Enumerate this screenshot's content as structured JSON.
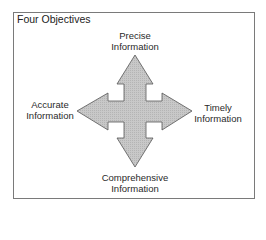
{
  "diagram": {
    "title": "Four Objectives",
    "colors": {
      "arrow_fill": "#c4c4c4",
      "arrow_stroke": "#555555",
      "frame_border": "#7a7a7a",
      "text": "#222222"
    },
    "objectives": [
      {
        "position": "top",
        "line1": "Precise",
        "line2": "Information"
      },
      {
        "position": "left",
        "line1": "Accurate",
        "line2": "Information"
      },
      {
        "position": "right",
        "line1": "Timely",
        "line2": "Information"
      },
      {
        "position": "bottom",
        "line1": "Comprehensive",
        "line2": "Information"
      }
    ],
    "shape": "four-way-arrow"
  }
}
